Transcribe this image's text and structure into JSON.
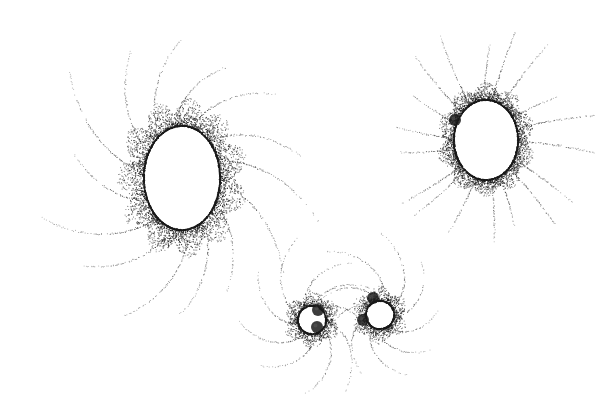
{
  "image": {
    "width": 615,
    "height": 418,
    "background": "#ffffff",
    "ink": "#1a1a1a",
    "style": "stipple ink illustration",
    "description": "Three stippled ring-shaped clusters with radiating curved tendrils on a white background"
  },
  "figures": [
    {
      "name": "large-oval-ring",
      "cx": 182,
      "cy": 178,
      "rx": 38,
      "ry": 52,
      "band": 26,
      "tendrils": 14,
      "tendril_length": 95,
      "swirl": 0.35,
      "lobes": 11,
      "node_dots": []
    },
    {
      "name": "teardrop-ring",
      "cx": 486,
      "cy": 140,
      "rx": 32,
      "ry": 40,
      "band": 16,
      "tendrils": 18,
      "tendril_length": 70,
      "swirl": 0.05,
      "lobes": 10,
      "node_dots": [
        [
          455,
          120
        ]
      ]
    },
    {
      "name": "small-ring-left",
      "cx": 312,
      "cy": 320,
      "rx": 14,
      "ry": 14,
      "band": 14,
      "tendrils": 9,
      "tendril_length": 60,
      "swirl": 0.6,
      "lobes": 6,
      "node_dots": [
        [
          318,
          310
        ],
        [
          317,
          327
        ]
      ]
    },
    {
      "name": "small-ring-right",
      "cx": 380,
      "cy": 315,
      "rx": 14,
      "ry": 14,
      "band": 14,
      "tendrils": 9,
      "tendril_length": 60,
      "swirl": -0.6,
      "lobes": 6,
      "node_dots": [
        [
          373,
          298
        ],
        [
          363,
          320
        ]
      ]
    }
  ]
}
